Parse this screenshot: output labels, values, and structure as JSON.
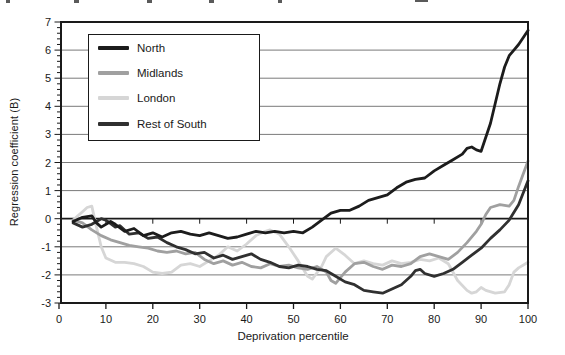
{
  "figure": {
    "y_axis_label": "Regression coefficient (B)",
    "x_axis_label": "Deprivation percentile"
  },
  "chart_data": {
    "type": "line",
    "title": "",
    "xlabel": "Deprivation percentile",
    "ylabel": "Regression coefficient (B)",
    "xlim": [
      0,
      100
    ],
    "ylim": [
      -3,
      7
    ],
    "xticks": [
      0,
      10,
      20,
      30,
      40,
      50,
      60,
      70,
      80,
      90,
      100
    ],
    "yticks": [
      -3,
      -2,
      -1,
      0,
      1,
      2,
      3,
      4,
      5,
      6,
      7
    ],
    "grid": "horizontal",
    "legend_position": "top-left-inside",
    "frame": true,
    "axis_color": "#1a1a1a",
    "gridline_color": "#7a7a7a",
    "series": [
      {
        "name": "North",
        "color": "#1c1c1c",
        "points": [
          [
            3,
            -0.1
          ],
          [
            5,
            0.05
          ],
          [
            7,
            0.1
          ],
          [
            8,
            -0.15
          ],
          [
            9,
            -0.3
          ],
          [
            11,
            -0.1
          ],
          [
            12,
            -0.2
          ],
          [
            14,
            -0.45
          ],
          [
            16,
            -0.35
          ],
          [
            18,
            -0.6
          ],
          [
            20,
            -0.5
          ],
          [
            22,
            -0.65
          ],
          [
            24,
            -0.5
          ],
          [
            26,
            -0.45
          ],
          [
            28,
            -0.55
          ],
          [
            30,
            -0.6
          ],
          [
            32,
            -0.5
          ],
          [
            34,
            -0.6
          ],
          [
            36,
            -0.7
          ],
          [
            38,
            -0.65
          ],
          [
            40,
            -0.55
          ],
          [
            42,
            -0.45
          ],
          [
            44,
            -0.5
          ],
          [
            46,
            -0.45
          ],
          [
            48,
            -0.5
          ],
          [
            50,
            -0.45
          ],
          [
            52,
            -0.5
          ],
          [
            54,
            -0.3
          ],
          [
            56,
            -0.05
          ],
          [
            58,
            0.2
          ],
          [
            60,
            0.3
          ],
          [
            62,
            0.3
          ],
          [
            64,
            0.45
          ],
          [
            66,
            0.65
          ],
          [
            68,
            0.75
          ],
          [
            70,
            0.85
          ],
          [
            72,
            1.1
          ],
          [
            74,
            1.3
          ],
          [
            76,
            1.4
          ],
          [
            78,
            1.45
          ],
          [
            80,
            1.7
          ],
          [
            82,
            1.9
          ],
          [
            84,
            2.1
          ],
          [
            86,
            2.3
          ],
          [
            87,
            2.5
          ],
          [
            88,
            2.55
          ],
          [
            89,
            2.45
          ],
          [
            90,
            2.4
          ],
          [
            91,
            2.9
          ],
          [
            92,
            3.4
          ],
          [
            93,
            4.1
          ],
          [
            94,
            4.8
          ],
          [
            95,
            5.4
          ],
          [
            96,
            5.8
          ],
          [
            97,
            6.0
          ],
          [
            98,
            6.2
          ],
          [
            99,
            6.45
          ],
          [
            100,
            6.7
          ]
        ]
      },
      {
        "name": "Midlands",
        "color": "#a0a0a0",
        "points": [
          [
            3,
            -0.05
          ],
          [
            5,
            -0.15
          ],
          [
            7,
            -0.4
          ],
          [
            9,
            -0.6
          ],
          [
            11,
            -0.75
          ],
          [
            13,
            -0.85
          ],
          [
            15,
            -0.95
          ],
          [
            17,
            -1.0
          ],
          [
            19,
            -1.05
          ],
          [
            21,
            -1.15
          ],
          [
            23,
            -1.2
          ],
          [
            25,
            -1.15
          ],
          [
            27,
            -1.25
          ],
          [
            29,
            -1.2
          ],
          [
            31,
            -1.45
          ],
          [
            33,
            -1.6
          ],
          [
            35,
            -1.5
          ],
          [
            37,
            -1.65
          ],
          [
            39,
            -1.55
          ],
          [
            41,
            -1.7
          ],
          [
            43,
            -1.75
          ],
          [
            45,
            -1.6
          ],
          [
            47,
            -1.7
          ],
          [
            49,
            -1.65
          ],
          [
            51,
            -1.75
          ],
          [
            53,
            -1.8
          ],
          [
            55,
            -1.7
          ],
          [
            57,
            -1.9
          ],
          [
            58,
            -2.2
          ],
          [
            59,
            -2.3
          ],
          [
            60,
            -2.1
          ],
          [
            61,
            -1.9
          ],
          [
            63,
            -1.6
          ],
          [
            65,
            -1.55
          ],
          [
            67,
            -1.7
          ],
          [
            69,
            -1.8
          ],
          [
            71,
            -1.65
          ],
          [
            73,
            -1.7
          ],
          [
            75,
            -1.6
          ],
          [
            77,
            -1.35
          ],
          [
            79,
            -1.25
          ],
          [
            81,
            -1.35
          ],
          [
            83,
            -1.45
          ],
          [
            85,
            -1.2
          ],
          [
            87,
            -0.85
          ],
          [
            89,
            -0.45
          ],
          [
            90,
            -0.2
          ],
          [
            91,
            0.15
          ],
          [
            92,
            0.4
          ],
          [
            94,
            0.5
          ],
          [
            96,
            0.45
          ],
          [
            97,
            0.65
          ],
          [
            98,
            1.15
          ],
          [
            100,
            2.05
          ]
        ]
      },
      {
        "name": "London",
        "color": "#d6d6d6",
        "points": [
          [
            3,
            -0.05
          ],
          [
            4,
            0.1
          ],
          [
            5,
            0.25
          ],
          [
            6,
            0.4
          ],
          [
            7,
            0.45
          ],
          [
            8,
            -0.3
          ],
          [
            9,
            -1.0
          ],
          [
            10,
            -1.4
          ],
          [
            12,
            -1.55
          ],
          [
            14,
            -1.55
          ],
          [
            16,
            -1.6
          ],
          [
            18,
            -1.7
          ],
          [
            20,
            -1.9
          ],
          [
            22,
            -1.95
          ],
          [
            24,
            -1.9
          ],
          [
            26,
            -1.65
          ],
          [
            28,
            -1.6
          ],
          [
            30,
            -1.7
          ],
          [
            32,
            -1.5
          ],
          [
            34,
            -1.3
          ],
          [
            36,
            -1.0
          ],
          [
            38,
            -1.15
          ],
          [
            40,
            -0.9
          ],
          [
            42,
            -0.6
          ],
          [
            44,
            -0.45
          ],
          [
            45,
            -0.4
          ],
          [
            47,
            -0.55
          ],
          [
            49,
            -1.0
          ],
          [
            51,
            -1.5
          ],
          [
            53,
            -2.05
          ],
          [
            54,
            -2.15
          ],
          [
            56,
            -1.7
          ],
          [
            57,
            -1.35
          ],
          [
            59,
            -1.05
          ],
          [
            61,
            -1.3
          ],
          [
            63,
            -1.6
          ],
          [
            65,
            -1.5
          ],
          [
            67,
            -1.6
          ],
          [
            69,
            -1.65
          ],
          [
            71,
            -1.5
          ],
          [
            73,
            -1.6
          ],
          [
            75,
            -1.55
          ],
          [
            77,
            -1.45
          ],
          [
            79,
            -1.5
          ],
          [
            81,
            -1.4
          ],
          [
            83,
            -1.6
          ],
          [
            85,
            -2.2
          ],
          [
            87,
            -2.55
          ],
          [
            88,
            -2.65
          ],
          [
            89,
            -2.6
          ],
          [
            90,
            -2.45
          ],
          [
            91,
            -2.55
          ],
          [
            93,
            -2.65
          ],
          [
            95,
            -2.6
          ],
          [
            96,
            -2.35
          ],
          [
            97,
            -1.9
          ],
          [
            98,
            -1.75
          ],
          [
            100,
            -1.55
          ]
        ]
      },
      {
        "name": "Rest of South",
        "color": "#303030",
        "points": [
          [
            3,
            -0.15
          ],
          [
            5,
            -0.3
          ],
          [
            7,
            -0.2
          ],
          [
            9,
            0.0
          ],
          [
            10,
            -0.05
          ],
          [
            12,
            -0.3
          ],
          [
            13,
            -0.25
          ],
          [
            15,
            -0.55
          ],
          [
            17,
            -0.5
          ],
          [
            19,
            -0.7
          ],
          [
            21,
            -0.65
          ],
          [
            23,
            -0.85
          ],
          [
            25,
            -1.0
          ],
          [
            27,
            -1.1
          ],
          [
            29,
            -1.25
          ],
          [
            31,
            -1.2
          ],
          [
            33,
            -1.4
          ],
          [
            35,
            -1.3
          ],
          [
            37,
            -1.45
          ],
          [
            39,
            -1.35
          ],
          [
            41,
            -1.25
          ],
          [
            43,
            -1.45
          ],
          [
            45,
            -1.55
          ],
          [
            47,
            -1.7
          ],
          [
            49,
            -1.75
          ],
          [
            51,
            -1.65
          ],
          [
            53,
            -1.7
          ],
          [
            55,
            -1.8
          ],
          [
            57,
            -1.85
          ],
          [
            59,
            -2.05
          ],
          [
            61,
            -2.25
          ],
          [
            63,
            -2.35
          ],
          [
            65,
            -2.55
          ],
          [
            67,
            -2.6
          ],
          [
            69,
            -2.65
          ],
          [
            71,
            -2.5
          ],
          [
            73,
            -2.35
          ],
          [
            75,
            -2.05
          ],
          [
            76,
            -1.85
          ],
          [
            77,
            -1.8
          ],
          [
            78,
            -1.95
          ],
          [
            80,
            -2.05
          ],
          [
            82,
            -1.95
          ],
          [
            84,
            -1.8
          ],
          [
            86,
            -1.55
          ],
          [
            88,
            -1.3
          ],
          [
            90,
            -1.05
          ],
          [
            92,
            -0.7
          ],
          [
            94,
            -0.4
          ],
          [
            96,
            -0.05
          ],
          [
            98,
            0.5
          ],
          [
            100,
            1.35
          ]
        ]
      }
    ]
  }
}
